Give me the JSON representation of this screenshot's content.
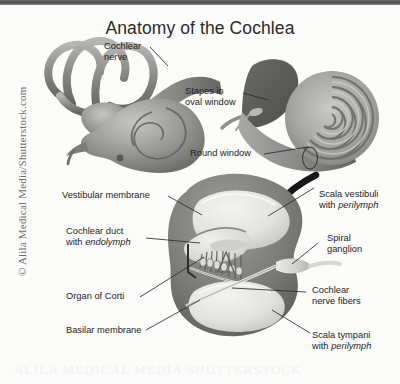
{
  "figure": {
    "title": "Anatomy of the Cochlea",
    "domain_type": "anatomical-diagram",
    "palette": {
      "background": "#fbfbfa",
      "top_border": "#4a4a4a",
      "tissue_dark": "#6f6f6f",
      "tissue_mid": "#9a9a9a",
      "tissue_light": "#d8d8d6",
      "chamber_fill": "#ececea",
      "label_text": "#1e1e1e",
      "leader_line": "#2a2a2a",
      "watermark": "#6d6d6d"
    }
  },
  "watermark": {
    "side": "© Alila Medical Media/Shutterstock.com",
    "bottom": "ALILA MEDICAL MEDIA SHUTTERSTOCK"
  },
  "panels": {
    "inner_ear_overview": {
      "name": "Inner ear with semicircular canals and cochlea",
      "labels": [
        {
          "id": "cochlear-nerve",
          "text": "Cochlear\nnerve",
          "line1": "Cochlear",
          "line2": "nerve"
        }
      ]
    },
    "cochlea_spiral": {
      "name": "Uncoiled cochlea spiral with stapes",
      "labels": [
        {
          "id": "stapes-oval-window",
          "line1": "Stapes in",
          "line2": "oval window"
        },
        {
          "id": "round-window",
          "line1": "Round window",
          "line2": ""
        }
      ]
    },
    "cross_section": {
      "name": "Cochlear duct cross-section",
      "labels_left": [
        {
          "id": "vestibular-membrane",
          "line1": "Vestibular membrane",
          "line2": "",
          "italic2": ""
        },
        {
          "id": "cochlear-duct",
          "line1": "Cochlear duct",
          "line2": "with ",
          "italic2": "endolymph"
        },
        {
          "id": "organ-of-corti",
          "line1": "Organ of Corti",
          "line2": "",
          "italic2": ""
        },
        {
          "id": "basilar-membrane",
          "line1": "Basilar membrane",
          "line2": "",
          "italic2": ""
        }
      ],
      "labels_right": [
        {
          "id": "scala-vestibuli",
          "line1": "Scala vestibuli",
          "line2": "with ",
          "italic2": "perilymph"
        },
        {
          "id": "spiral-ganglion",
          "line1": "Spiral",
          "line2": "ganglion",
          "italic2": ""
        },
        {
          "id": "cochlear-nerve-fibers",
          "line1": "Cochlear",
          "line2": "nerve fibers",
          "italic2": ""
        },
        {
          "id": "scala-tympani",
          "line1": "Scala tympani",
          "line2": "with ",
          "italic2": "perilymph"
        }
      ]
    }
  }
}
